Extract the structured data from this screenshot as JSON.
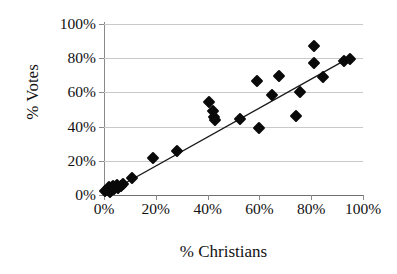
{
  "chart_data": {
    "type": "scatter",
    "title": "",
    "xlabel": "% Christians",
    "ylabel": "% Votes",
    "xlim": [
      0,
      100
    ],
    "ylim": [
      0,
      100
    ],
    "xticks": [
      "0%",
      "20%",
      "40%",
      "60%",
      "80%",
      "100%"
    ],
    "xtick_values": [
      0,
      20,
      40,
      60,
      80,
      100
    ],
    "yticks": [
      "0%",
      "20%",
      "40%",
      "60%",
      "80%",
      "100%"
    ],
    "ytick_values": [
      0,
      20,
      40,
      60,
      80,
      100
    ],
    "grid": "horizontal",
    "legend": "none",
    "marker": "filled-diamond",
    "marker_color": "#0a0a0a",
    "points": [
      {
        "x": 0.5,
        "y": 2.5
      },
      {
        "x": 1.5,
        "y": 3.0
      },
      {
        "x": 2.0,
        "y": 4.5
      },
      {
        "x": 2.5,
        "y": 2.0
      },
      {
        "x": 3.5,
        "y": 5.0
      },
      {
        "x": 4.0,
        "y": 3.5
      },
      {
        "x": 5.0,
        "y": 6.0
      },
      {
        "x": 5.5,
        "y": 4.0
      },
      {
        "x": 6.5,
        "y": 5.5
      },
      {
        "x": 7.5,
        "y": 6.5
      },
      {
        "x": 11.0,
        "y": 10.0
      },
      {
        "x": 19.0,
        "y": 21.5
      },
      {
        "x": 28.0,
        "y": 25.5
      },
      {
        "x": 40.5,
        "y": 54.5
      },
      {
        "x": 42.0,
        "y": 49.0
      },
      {
        "x": 42.5,
        "y": 45.5
      },
      {
        "x": 43.0,
        "y": 44.0
      },
      {
        "x": 52.5,
        "y": 44.5
      },
      {
        "x": 59.0,
        "y": 66.5
      },
      {
        "x": 60.0,
        "y": 39.0
      },
      {
        "x": 65.0,
        "y": 58.5
      },
      {
        "x": 67.5,
        "y": 69.5
      },
      {
        "x": 74.0,
        "y": 46.0
      },
      {
        "x": 75.5,
        "y": 60.0
      },
      {
        "x": 81.0,
        "y": 87.0
      },
      {
        "x": 81.0,
        "y": 77.0
      },
      {
        "x": 84.5,
        "y": 69.0
      },
      {
        "x": 92.5,
        "y": 78.5
      },
      {
        "x": 95.0,
        "y": 79.5
      }
    ],
    "trendline": {
      "present": true,
      "color": "#1a1a1a",
      "x_start": 0.0,
      "y_start": 0.0,
      "x_end": 95.0,
      "y_end": 80.5
    }
  }
}
